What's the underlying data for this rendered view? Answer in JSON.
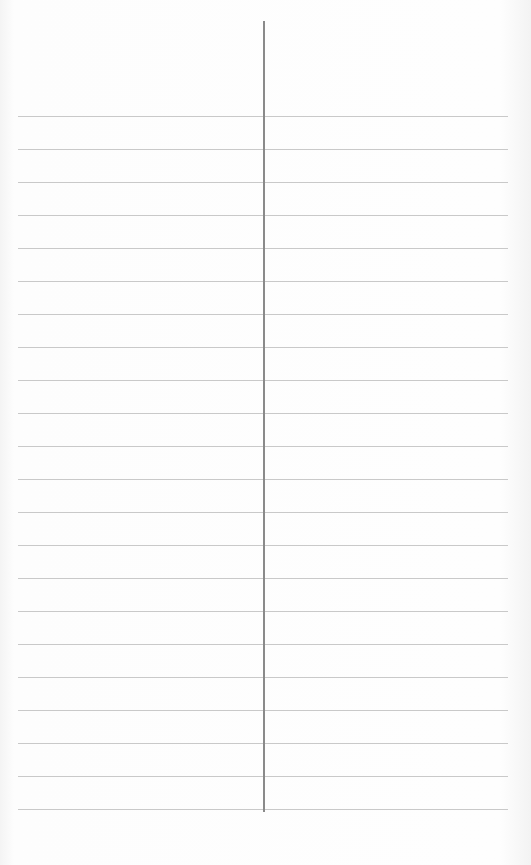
{
  "sheet": {
    "type": "ruled-paper",
    "ruled_line_count": 22,
    "first_line_y": 116,
    "line_spacing": 33,
    "line_left": 18,
    "line_width": 490,
    "line_color": "#c9c9c9",
    "divider": {
      "x": 263,
      "top": 21,
      "bottom": 812,
      "color": "#8a8a8a"
    },
    "left_column_text": [],
    "right_column_text": []
  }
}
